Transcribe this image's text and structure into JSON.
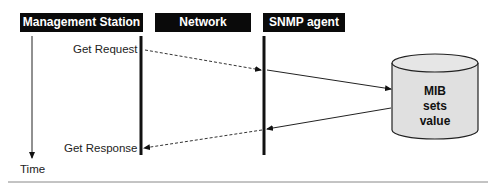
{
  "headers": {
    "management_station": "Management Station",
    "network": "Network",
    "snmp_agent": "SNMP agent"
  },
  "messages": {
    "get_request": "Get Request",
    "get_response": "Get Response"
  },
  "time_axis": {
    "label": "Time"
  },
  "database": {
    "line1": "MIB",
    "line2": "sets",
    "line3": "value"
  },
  "colors": {
    "header_bg": "#0a0a0a",
    "header_text": "#ffffff",
    "cylinder_fill": "#e0e0e0",
    "line": "#111111",
    "rule": "#888888"
  }
}
